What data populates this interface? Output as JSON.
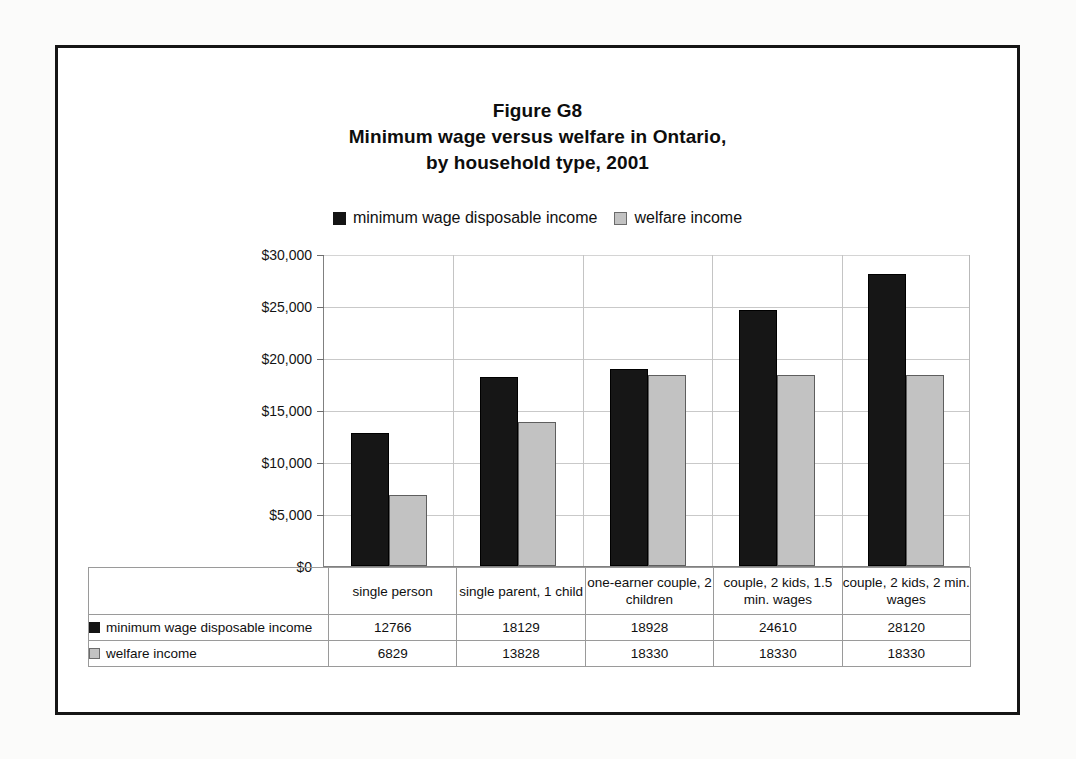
{
  "figure": {
    "title_lines": [
      "Figure G8",
      "Minimum wage versus welfare in Ontario,",
      "by household type, 2001"
    ]
  },
  "legend": {
    "entries": [
      {
        "label": "minimum wage disposable income",
        "swatch": "black-square-icon",
        "color": "#161616"
      },
      {
        "label": "welfare income",
        "swatch": "gray-square-icon",
        "color": "#c2c2c2"
      }
    ]
  },
  "axis": {
    "y_ticks": [
      "$0",
      "$5,000",
      "$10,000",
      "$15,000",
      "$20,000",
      "$25,000",
      "$30,000"
    ]
  },
  "table": {
    "row_labels": [
      "minimum wage disposable income",
      "welfare income"
    ],
    "categories": [
      "single person",
      "single parent, 1 child",
      "one-earner couple, 2 children",
      "couple, 2 kids, 1.5 min. wages",
      "couple, 2 kids, 2 min. wages"
    ],
    "rows": [
      [
        "12766",
        "18129",
        "18928",
        "24610",
        "28120"
      ],
      [
        "6829",
        "13828",
        "18330",
        "18330",
        "18330"
      ]
    ]
  },
  "chart_data": {
    "type": "bar",
    "xlabel": "",
    "ylabel": "",
    "ylim": [
      0,
      30000
    ],
    "ytick_values": [
      0,
      5000,
      10000,
      15000,
      20000,
      25000,
      30000
    ],
    "ytick_labels": [
      "$0",
      "$5,000",
      "$10,000",
      "$15,000",
      "$20,000",
      "$25,000",
      "$30,000"
    ],
    "grid": true,
    "legend_position": "top-center",
    "categories": [
      "single person",
      "single parent, 1 child",
      "one-earner couple, 2 children",
      "couple, 2 kids, 1.5 min. wages",
      "couple, 2 kids, 2 min. wages"
    ],
    "series": [
      {
        "name": "minimum wage disposable income",
        "color": "#161616",
        "values": [
          12766,
          18129,
          18928,
          24610,
          28120
        ]
      },
      {
        "name": "welfare income",
        "color": "#c2c2c2",
        "values": [
          6829,
          13828,
          18330,
          18330,
          18330
        ]
      }
    ]
  }
}
